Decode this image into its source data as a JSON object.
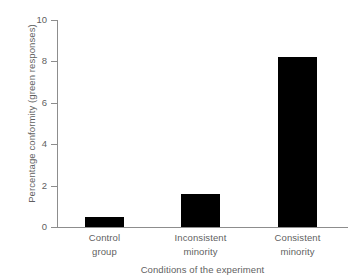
{
  "chart_data": {
    "type": "bar",
    "title": "",
    "xlabel": "Conditions of the experiment",
    "ylabel": "Percentage conformity (green responses)",
    "categories": [
      "Control group",
      "Inconsistent minority",
      "Consistent minority"
    ],
    "category_lines": [
      [
        "Control",
        "group"
      ],
      [
        "Inconsistent",
        "minority"
      ],
      [
        "Consistent",
        "minority"
      ]
    ],
    "values": [
      0.5,
      1.6,
      8.2
    ],
    "ylim": [
      0,
      10
    ],
    "yticks": [
      0,
      2,
      4,
      6,
      8,
      10
    ],
    "ytick_labels": [
      "0",
      "2",
      "4",
      "6",
      "8",
      "10"
    ],
    "grid": false,
    "legend": false,
    "bar_color": "#000000",
    "axis_color": "#8d8d8d",
    "text_color": "#5f5f5f",
    "background_color": "#ffffff"
  }
}
